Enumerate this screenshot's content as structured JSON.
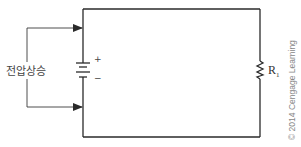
{
  "diagram": {
    "type": "circuit",
    "title": "",
    "source_label": "전압상승",
    "battery": {
      "positive_sign": "+",
      "negative_sign": "−"
    },
    "resistor": {
      "label": "R",
      "subscript": "1"
    },
    "copyright": "© 2014 Cengage Learning",
    "colors": {
      "wire": "#2a2a2a",
      "text": "#444444",
      "copyright": "#888888"
    }
  }
}
